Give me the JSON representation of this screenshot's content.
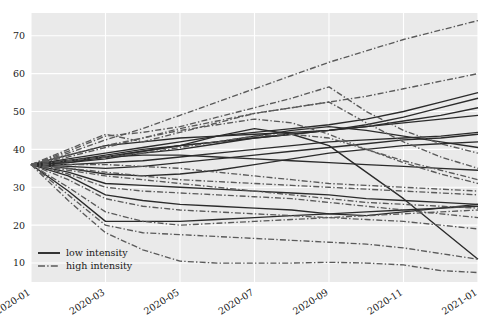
{
  "chart_data": {
    "type": "line",
    "title": "",
    "xlabel": "",
    "ylabel": "",
    "grid": true,
    "legend_position": "bottom-left",
    "x": [
      "2020-01",
      "2020-02",
      "2020-03",
      "2020-04",
      "2020-05",
      "2020-06",
      "2020-07",
      "2020-08",
      "2020-09",
      "2020-10",
      "2020-11",
      "2020-12",
      "2021-01"
    ],
    "xtick_labels": [
      "2020-01",
      "2020-03",
      "2020-05",
      "2020-07",
      "2020-09",
      "2020-11",
      "2021-01"
    ],
    "ytick_labels": [
      "10",
      "20",
      "30",
      "40",
      "50",
      "60",
      "70"
    ],
    "ylim": [
      5,
      76
    ],
    "xlim": [
      0,
      12
    ],
    "colors": {
      "low_intensity": "#2b2b2b",
      "high_intensity": "#5a5a5a",
      "plot_background": "#eaeaea",
      "gridline": "#ffffff",
      "figure_background": "#ffffff",
      "text": "#1a1a1a"
    },
    "legend": [
      {
        "label": "low intensity",
        "style": "solid",
        "color": "#2b2b2b"
      },
      {
        "label": "high intensity",
        "style": "dashdot",
        "color": "#5a5a5a"
      }
    ],
    "series": [
      {
        "name": "low-1",
        "group": "low intensity",
        "style": "solid",
        "values": [
          36.0,
          37.5,
          39.0,
          40.5,
          42.0,
          43.5,
          44.5,
          45.5,
          46.5,
          48.0,
          50.0,
          52.5,
          55.0
        ]
      },
      {
        "name": "low-2",
        "group": "low intensity",
        "style": "solid",
        "values": [
          36.0,
          37.0,
          38.5,
          40.0,
          41.0,
          42.0,
          43.0,
          44.0,
          45.0,
          46.5,
          48.5,
          51.0,
          53.5
        ]
      },
      {
        "name": "low-3",
        "group": "low intensity",
        "style": "solid",
        "values": [
          36.0,
          38.5,
          41.0,
          42.0,
          43.0,
          43.5,
          44.0,
          44.5,
          45.0,
          46.0,
          47.5,
          49.0,
          51.0
        ]
      },
      {
        "name": "low-4",
        "group": "low intensity",
        "style": "solid",
        "values": [
          36.0,
          36.5,
          37.5,
          39.0,
          40.0,
          41.5,
          43.0,
          44.0,
          45.0,
          46.0,
          47.0,
          48.0,
          49.0
        ]
      },
      {
        "name": "low-5",
        "group": "low intensity",
        "style": "solid",
        "values": [
          36.0,
          37.0,
          38.0,
          39.5,
          41.0,
          42.0,
          43.5,
          45.0,
          46.0,
          45.0,
          43.5,
          42.0,
          40.5
        ]
      },
      {
        "name": "low-6",
        "group": "low intensity",
        "style": "solid",
        "values": [
          36.0,
          36.0,
          36.5,
          37.0,
          38.0,
          39.0,
          40.0,
          41.0,
          42.0,
          42.5,
          43.0,
          43.5,
          44.5
        ]
      },
      {
        "name": "low-7",
        "group": "low intensity",
        "style": "solid",
        "values": [
          36.0,
          35.5,
          35.0,
          35.5,
          36.5,
          37.5,
          38.5,
          39.5,
          40.5,
          41.5,
          42.5,
          43.0,
          44.0
        ]
      },
      {
        "name": "low-8",
        "group": "low intensity",
        "style": "solid",
        "values": [
          36.0,
          36.5,
          38.0,
          38.5,
          38.5,
          38.0,
          37.5,
          37.0,
          36.5,
          36.0,
          35.5,
          35.0,
          34.5
        ]
      },
      {
        "name": "low-9",
        "group": "low intensity",
        "style": "solid",
        "values": [
          36.0,
          35.0,
          33.5,
          33.0,
          33.5,
          34.5,
          36.0,
          37.5,
          39.0,
          40.0,
          41.0,
          41.5,
          42.0
        ]
      },
      {
        "name": "low-10",
        "group": "low intensity",
        "style": "solid",
        "values": [
          36.0,
          34.0,
          31.0,
          30.5,
          30.0,
          29.5,
          29.0,
          28.5,
          28.0,
          27.0,
          26.5,
          26.0,
          25.5
        ]
      },
      {
        "name": "low-11",
        "group": "low intensity",
        "style": "solid",
        "values": [
          36.0,
          33.0,
          28.0,
          26.5,
          25.5,
          25.0,
          24.5,
          24.0,
          23.0,
          22.5,
          23.5,
          24.5,
          25.5
        ]
      },
      {
        "name": "low-12",
        "group": "low intensity",
        "style": "solid",
        "values": [
          36.0,
          29.0,
          21.0,
          21.0,
          21.0,
          21.5,
          22.0,
          22.5,
          23.0,
          23.5,
          24.0,
          24.5,
          25.0
        ]
      },
      {
        "name": "low-13",
        "group": "low intensity",
        "style": "solid",
        "values": [
          36.0,
          37.0,
          38.0,
          39.5,
          41.0,
          43.5,
          45.5,
          44.0,
          41.0,
          34.0,
          27.0,
          19.0,
          11.0
        ]
      },
      {
        "name": "high-1",
        "group": "high intensity",
        "style": "dashdot",
        "values": [
          36.0,
          39.0,
          42.5,
          45.5,
          49.0,
          52.5,
          56.0,
          59.5,
          63.0,
          66.0,
          69.0,
          71.5,
          74.0
        ]
      },
      {
        "name": "high-2",
        "group": "high intensity",
        "style": "dashdot",
        "values": [
          36.0,
          38.0,
          40.5,
          43.0,
          45.5,
          47.5,
          49.5,
          51.0,
          52.5,
          54.0,
          56.0,
          58.0,
          60.0
        ]
      },
      {
        "name": "high-3",
        "group": "high intensity",
        "style": "dashdot",
        "values": [
          36.0,
          39.5,
          43.5,
          44.5,
          46.0,
          48.5,
          51.0,
          53.5,
          56.5,
          50.0,
          45.0,
          41.5,
          39.0
        ]
      },
      {
        "name": "high-4",
        "group": "high intensity",
        "style": "dashdot",
        "values": [
          36.0,
          40.0,
          44.0,
          42.0,
          44.5,
          47.0,
          49.5,
          51.0,
          52.5,
          47.0,
          42.0,
          38.0,
          35.0
        ]
      },
      {
        "name": "high-5",
        "group": "high intensity",
        "style": "dashdot",
        "values": [
          36.0,
          38.5,
          41.0,
          43.0,
          45.0,
          46.5,
          48.0,
          47.0,
          44.0,
          40.0,
          36.5,
          33.5,
          31.0
        ]
      },
      {
        "name": "high-6",
        "group": "high intensity",
        "style": "dashdot",
        "values": [
          36.0,
          37.0,
          38.0,
          39.0,
          40.5,
          42.0,
          43.5,
          44.0,
          43.0,
          40.0,
          37.0,
          34.5,
          32.0
        ]
      },
      {
        "name": "high-7",
        "group": "high intensity",
        "style": "dashdot",
        "values": [
          36.0,
          36.0,
          36.0,
          35.5,
          35.0,
          34.0,
          33.0,
          32.0,
          31.0,
          30.5,
          30.0,
          29.5,
          29.0
        ]
      },
      {
        "name": "high-8",
        "group": "high intensity",
        "style": "dashdot",
        "values": [
          36.0,
          35.0,
          34.0,
          33.0,
          32.0,
          31.5,
          31.0,
          30.5,
          30.0,
          29.5,
          29.0,
          28.5,
          28.0
        ]
      },
      {
        "name": "high-9",
        "group": "high intensity",
        "style": "dashdot",
        "values": [
          36.0,
          34.5,
          33.0,
          32.0,
          31.0,
          30.0,
          29.0,
          28.0,
          27.0,
          26.0,
          25.5,
          25.0,
          24.5
        ]
      },
      {
        "name": "high-10",
        "group": "high intensity",
        "style": "dashdot",
        "values": [
          36.0,
          33.5,
          30.0,
          29.0,
          28.5,
          28.0,
          27.5,
          27.0,
          26.0,
          25.0,
          24.0,
          23.0,
          22.0
        ]
      },
      {
        "name": "high-11",
        "group": "high intensity",
        "style": "dashdot",
        "values": [
          36.0,
          32.0,
          27.0,
          25.0,
          24.0,
          23.5,
          23.0,
          22.5,
          22.0,
          21.5,
          21.0,
          20.0,
          19.0
        ]
      },
      {
        "name": "high-12",
        "group": "high intensity",
        "style": "dashdot",
        "values": [
          36.0,
          30.0,
          23.5,
          21.0,
          20.0,
          20.5,
          21.0,
          21.5,
          22.0,
          22.5,
          23.0,
          23.5,
          24.0
        ]
      },
      {
        "name": "high-13",
        "group": "high intensity",
        "style": "dashdot",
        "values": [
          36.0,
          28.0,
          20.0,
          18.0,
          17.5,
          17.0,
          16.5,
          16.0,
          15.5,
          15.0,
          14.0,
          12.5,
          11.0
        ]
      },
      {
        "name": "high-14",
        "group": "high intensity",
        "style": "dashdot",
        "values": [
          36.0,
          26.5,
          18.0,
          13.5,
          10.5,
          10.0,
          10.0,
          10.0,
          10.2,
          10.0,
          9.5,
          8.0,
          7.5
        ]
      }
    ]
  },
  "legend": {
    "items": [
      {
        "label": "low intensity"
      },
      {
        "label": "high intensity"
      }
    ]
  }
}
